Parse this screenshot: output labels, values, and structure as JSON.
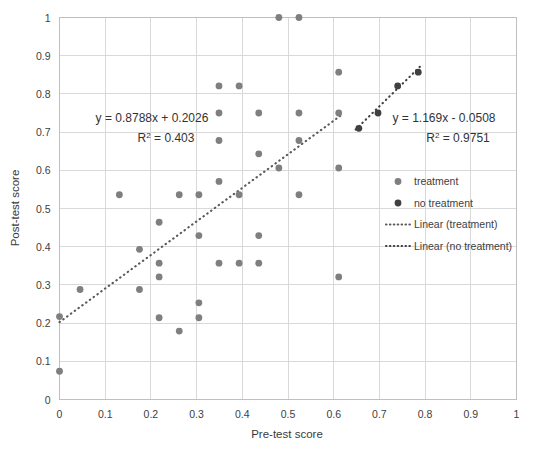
{
  "chart_data": {
    "type": "scatter",
    "title": "",
    "xlabel": "Pre-test score",
    "ylabel": "Post-test score",
    "xlim": [
      0,
      1
    ],
    "ylim": [
      0,
      1
    ],
    "xticks": [
      "0",
      "0.1",
      "0.2",
      "0.3",
      "0.4",
      "0.5",
      "0.6",
      "0.7",
      "0.8",
      "0.9",
      "1"
    ],
    "yticks": [
      "0",
      "0.1",
      "0.2",
      "0.3",
      "0.4",
      "0.5",
      "0.6",
      "0.7",
      "0.8",
      "0.9",
      "1"
    ],
    "grid": true,
    "legend_position": "right",
    "series": [
      {
        "name": "treatment",
        "marker": "circle",
        "color": "#7f7f7f",
        "points": [
          [
            0.0,
            0.217
          ],
          [
            0.0,
            0.074
          ],
          [
            0.045,
            0.288
          ],
          [
            0.131,
            0.536
          ],
          [
            0.175,
            0.393
          ],
          [
            0.175,
            0.288
          ],
          [
            0.218,
            0.464
          ],
          [
            0.218,
            0.357
          ],
          [
            0.218,
            0.321
          ],
          [
            0.218,
            0.214
          ],
          [
            0.262,
            0.536
          ],
          [
            0.262,
            0.179
          ],
          [
            0.305,
            0.536
          ],
          [
            0.305,
            0.429
          ],
          [
            0.305,
            0.253
          ],
          [
            0.305,
            0.214
          ],
          [
            0.349,
            0.821
          ],
          [
            0.349,
            0.75
          ],
          [
            0.349,
            0.678
          ],
          [
            0.349,
            0.571
          ],
          [
            0.349,
            0.357
          ],
          [
            0.393,
            0.821
          ],
          [
            0.393,
            0.536
          ],
          [
            0.393,
            0.357
          ],
          [
            0.436,
            0.75
          ],
          [
            0.436,
            0.643
          ],
          [
            0.436,
            0.429
          ],
          [
            0.436,
            0.357
          ],
          [
            0.48,
            1.0
          ],
          [
            0.48,
            0.606
          ],
          [
            0.524,
            1.0
          ],
          [
            0.524,
            0.75
          ],
          [
            0.524,
            0.678
          ],
          [
            0.524,
            0.536
          ],
          [
            0.611,
            0.857
          ],
          [
            0.611,
            0.75
          ],
          [
            0.611,
            0.606
          ],
          [
            0.611,
            0.321
          ]
        ]
      },
      {
        "name": "no treatment",
        "marker": "circle",
        "color": "#404040",
        "points": [
          [
            0.655,
            0.71
          ],
          [
            0.697,
            0.75
          ],
          [
            0.74,
            0.821
          ],
          [
            0.785,
            0.857
          ]
        ]
      }
    ],
    "trendlines": [
      {
        "name": "Linear (treatment)",
        "style": "dotted",
        "color": "#595959",
        "slope": 0.8788,
        "intercept": 0.2026,
        "equation": "y = 0.8788x + 0.2026",
        "r2_label": "R",
        "r2_sup": "2",
        "r2_value": " = 0.403",
        "x_start": 0.0,
        "x_end": 0.615
      },
      {
        "name": "Linear (no treatment)",
        "style": "dotted",
        "color": "#404040",
        "slope": 1.169,
        "intercept": -0.0508,
        "equation": "y = 1.169x - 0.0508",
        "r2_label": "R",
        "r2_sup": "2",
        "r2_value": " = 0.9751",
        "x_start": 0.648,
        "x_end": 0.79
      }
    ],
    "annotations": [
      {
        "id": "treatment-equation",
        "line1": "y = 0.8788x + 0.2026",
        "r2_prefix": "R",
        "r2_sup": "2",
        "r2_rest": " = 0.403"
      },
      {
        "id": "no-treatment-equation",
        "line1": "y = 1.169x - 0.0508",
        "r2_prefix": "R",
        "r2_sup": "2",
        "r2_rest": " = 0.9751"
      }
    ],
    "legend": [
      {
        "label": "treatment",
        "type": "marker",
        "color": "#7f7f7f"
      },
      {
        "label": "no treatment",
        "type": "marker",
        "color": "#404040"
      },
      {
        "label": "Linear (treatment)",
        "type": "line",
        "color": "#595959"
      },
      {
        "label": "Linear (no treatment)",
        "type": "line",
        "color": "#404040"
      }
    ],
    "colors": {
      "grid": "#d9d9d9",
      "frame": "#bfbfbf",
      "text": "#404040",
      "treatment": "#7f7f7f",
      "no_treatment": "#404040",
      "background": "#ffffff"
    }
  }
}
